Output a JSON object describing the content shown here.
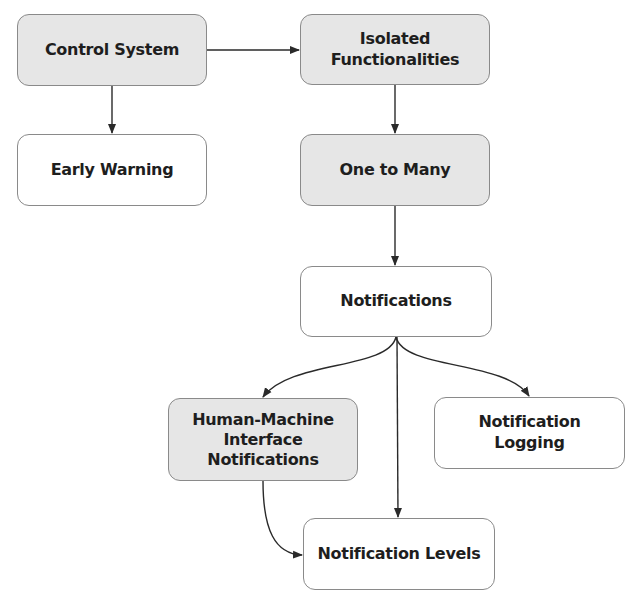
{
  "diagram": {
    "nodes": [
      {
        "id": "control-system",
        "label": "Control System",
        "fill": "#e6e6e6"
      },
      {
        "id": "early-warning",
        "label": "Early Warning",
        "fill": "#ffffff"
      },
      {
        "id": "isolated-functionalities",
        "label": "Isolated\nFunctionalities",
        "fill": "#e6e6e6"
      },
      {
        "id": "one-to-many",
        "label": "One to Many",
        "fill": "#e6e6e6"
      },
      {
        "id": "notifications",
        "label": "Notifications",
        "fill": "#ffffff"
      },
      {
        "id": "hmi-notifications",
        "label": "Human-Machine\nInterface\nNotifications",
        "fill": "#e6e6e6"
      },
      {
        "id": "notification-logging",
        "label": "Notification\nLogging",
        "fill": "#ffffff"
      },
      {
        "id": "notification-levels",
        "label": "Notification Levels",
        "fill": "#ffffff"
      }
    ],
    "edges": [
      {
        "from": "control-system",
        "to": "isolated-functionalities"
      },
      {
        "from": "control-system",
        "to": "early-warning"
      },
      {
        "from": "isolated-functionalities",
        "to": "one-to-many"
      },
      {
        "from": "one-to-many",
        "to": "notifications"
      },
      {
        "from": "notifications",
        "to": "hmi-notifications"
      },
      {
        "from": "notifications",
        "to": "notification-logging"
      },
      {
        "from": "notifications",
        "to": "notification-levels"
      },
      {
        "from": "hmi-notifications",
        "to": "notification-levels"
      }
    ]
  }
}
